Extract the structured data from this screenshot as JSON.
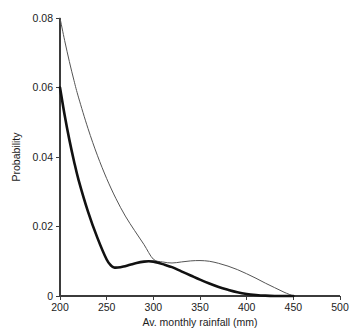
{
  "header": {
    "faint_artifact": " "
  },
  "chart_data": {
    "type": "line",
    "title": "",
    "xlabel": "Av. monthly rainfall (mm)",
    "ylabel": "Probability",
    "xlim": [
      200,
      500
    ],
    "ylim": [
      0,
      0.08
    ],
    "grid": false,
    "legend": "none",
    "xticks": [
      200,
      250,
      300,
      350,
      400,
      450,
      500
    ],
    "xtick_labels": [
      "200",
      "250",
      "300",
      "350",
      "400",
      "450",
      "500"
    ],
    "yticks": [
      0,
      0.02,
      0.04,
      0.06,
      0.08
    ],
    "ytick_labels": [
      "0",
      "0.02",
      "0.04",
      "0.06",
      "0.08"
    ],
    "series": [
      {
        "name": "thin-curve",
        "style": "thin",
        "color": "#555555",
        "x": [
          200,
          205,
          210,
          215,
          220,
          230,
          240,
          250,
          260,
          270,
          280,
          290,
          300,
          310,
          320,
          330,
          340,
          350,
          360,
          370,
          380,
          390,
          400,
          410,
          420,
          430,
          440,
          450
        ],
        "y": [
          0.08,
          0.0735,
          0.0675,
          0.062,
          0.057,
          0.0482,
          0.0405,
          0.0338,
          0.028,
          0.023,
          0.0188,
          0.0148,
          0.0106,
          0.0098,
          0.0095,
          0.0098,
          0.0101,
          0.0102,
          0.01,
          0.0094,
          0.0086,
          0.0076,
          0.0064,
          0.0051,
          0.0037,
          0.0024,
          0.0011,
          0.0
        ]
      },
      {
        "name": "thick-curve",
        "style": "thick",
        "color": "#111111",
        "x": [
          200,
          205,
          210,
          215,
          220,
          230,
          240,
          250,
          255,
          258,
          262,
          268,
          275,
          282,
          290,
          295,
          300,
          305,
          312,
          320,
          330,
          340,
          350,
          360,
          370,
          380,
          390,
          400,
          410,
          420,
          430,
          440,
          450
        ],
        "y": [
          0.06,
          0.052,
          0.045,
          0.0388,
          0.0333,
          0.0243,
          0.0168,
          0.0105,
          0.0087,
          0.0082,
          0.0082,
          0.0085,
          0.009,
          0.0095,
          0.0099,
          0.01,
          0.0099,
          0.0096,
          0.009,
          0.0083,
          0.0071,
          0.0059,
          0.0047,
          0.0036,
          0.0026,
          0.0018,
          0.0011,
          0.0006,
          0.0003,
          0.0001,
          0.0,
          0.0,
          0.0
        ]
      }
    ]
  }
}
